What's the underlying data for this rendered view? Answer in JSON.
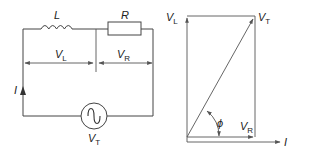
{
  "circuit": {
    "inductor": {
      "symbol": "L"
    },
    "resistor": {
      "symbol": "R"
    },
    "voltage_L": {
      "main": "V",
      "sub": "L"
    },
    "voltage_R": {
      "main": "V",
      "sub": "R"
    },
    "current": {
      "symbol": "I"
    },
    "source": {
      "main": "V",
      "sub": "T",
      "type": "ac-source"
    }
  },
  "phasor": {
    "vl": {
      "main": "V",
      "sub": "L"
    },
    "vt": {
      "main": "V",
      "sub": "T"
    },
    "vr": {
      "main": "V",
      "sub": "R"
    },
    "current": {
      "symbol": "I"
    },
    "angle": {
      "symbol": "ϕ"
    }
  },
  "colors": {
    "line": "#444444",
    "background": "#ffffff"
  }
}
